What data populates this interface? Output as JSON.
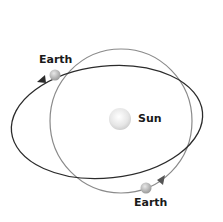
{
  "diagram": {
    "sun": {
      "label": "Sun"
    },
    "earth_positions": [
      {
        "label": "Earth",
        "position": "upper-left on dark elliptical orbit"
      },
      {
        "label": "Earth",
        "position": "lower-right on light circular orbit"
      }
    ],
    "orbits": [
      {
        "name": "elliptical-orbit",
        "color": "#2b2b2b",
        "direction": "counterclockwise"
      },
      {
        "name": "circular-orbit",
        "color": "#8a8a8a",
        "direction": "counterclockwise"
      }
    ]
  }
}
